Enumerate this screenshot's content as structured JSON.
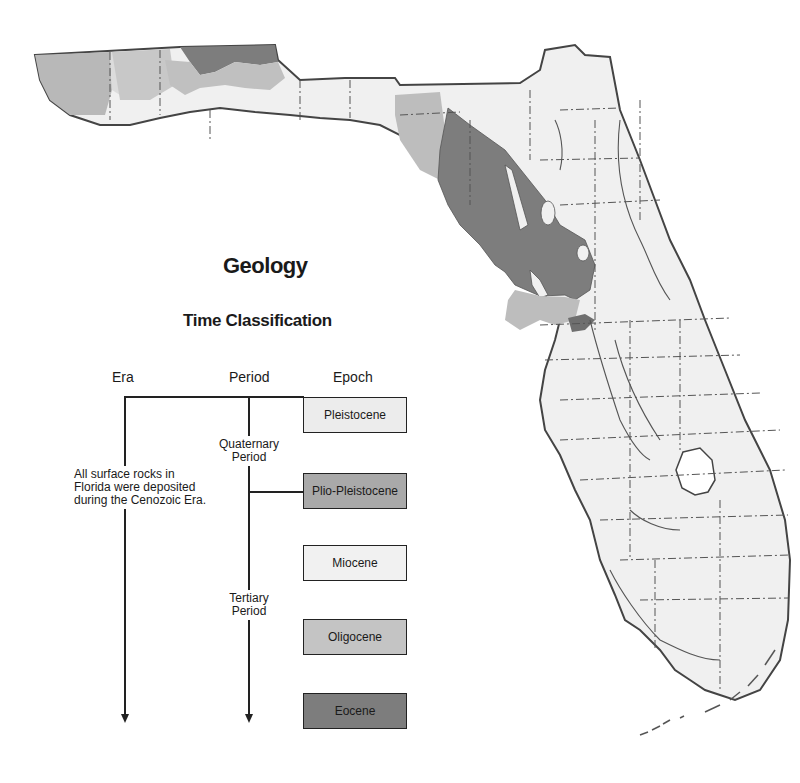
{
  "title": "Geology",
  "subtitle": "Time Classification",
  "columns": {
    "era": "Era",
    "period": "Period",
    "epoch": "Epoch"
  },
  "era_note": {
    "line1": "All surface rocks in",
    "line2": "Florida were deposited",
    "line3": "during the Cenozoic Era."
  },
  "periods": [
    {
      "line1": "Quaternary",
      "line2": "Period"
    },
    {
      "line1": "Tertiary",
      "line2": "Period"
    }
  ],
  "epochs": [
    {
      "label": "Pleistocene",
      "color": "#ececec"
    },
    {
      "label": "Plio-Pleistocene",
      "color": "#a9a9a9"
    },
    {
      "label": "Miocene",
      "color": "#f1f1f1"
    },
    {
      "label": "Oligocene",
      "color": "#c4c4c4"
    },
    {
      "label": "Eocene",
      "color": "#7d7d7d"
    }
  ],
  "map": {
    "region": "Florida",
    "legend_colors": {
      "pleistocene": "#ececec",
      "plio_pleistocene": "#a9a9a9",
      "miocene": "#f1f1f1",
      "oligocene": "#c4c4c4",
      "eocene": "#7d7d7d"
    }
  }
}
